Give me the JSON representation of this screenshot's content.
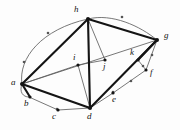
{
  "figure": {
    "background_color": "#fdfdfd",
    "stroke_color": "#141414",
    "thin_stroke_color": "#555555",
    "width": 180,
    "height": 130
  },
  "nodes": [
    {
      "id": "a",
      "label": "a",
      "x": 22,
      "y": 84,
      "label_x": 12,
      "label_y": 79
    },
    {
      "id": "b",
      "label": "b",
      "x": 29,
      "y": 97,
      "label_x": 25,
      "label_y": 100
    },
    {
      "id": "c",
      "label": "c",
      "x": 58,
      "y": 110,
      "label_x": 53,
      "label_y": 113
    },
    {
      "id": "d",
      "label": "d",
      "x": 90,
      "y": 108,
      "label_x": 87,
      "label_y": 113
    },
    {
      "id": "e",
      "label": "e",
      "x": 113,
      "y": 93,
      "label_x": 112,
      "label_y": 97
    },
    {
      "id": "f",
      "label": "f",
      "x": 146,
      "y": 70,
      "label_x": 150,
      "label_y": 70
    },
    {
      "id": "g",
      "label": "g",
      "x": 157,
      "y": 40,
      "label_x": 164,
      "label_y": 34
    },
    {
      "id": "h",
      "label": "h",
      "x": 88,
      "y": 19,
      "label_x": 75,
      "label_y": 7
    },
    {
      "id": "i",
      "label": "i",
      "x": 78,
      "y": 65,
      "label_x": 73,
      "label_y": 55
    },
    {
      "id": "j",
      "label": "j",
      "x": 105,
      "y": 60,
      "label_x": 104,
      "label_y": 63
    },
    {
      "id": "k",
      "label": "k",
      "x": 138,
      "y": 60,
      "label_x": 130,
      "label_y": 50
    }
  ],
  "edges_thick": [
    {
      "from": "a",
      "to": "h",
      "width": 2.2
    },
    {
      "from": "a",
      "to": "d",
      "width": 2.2
    },
    {
      "from": "a",
      "to": "b",
      "width": 2.2
    },
    {
      "from": "h",
      "to": "d",
      "width": 2.2
    },
    {
      "from": "h",
      "to": "g",
      "width": 2.2
    },
    {
      "from": "d",
      "to": "g",
      "width": 2.2
    },
    {
      "from": "g",
      "to": "k",
      "width": 2.0
    },
    {
      "from": "k",
      "to": "d",
      "width": 1.2
    }
  ],
  "edges_thin": [
    {
      "from": "a",
      "to": "g",
      "width": 0.8
    },
    {
      "from": "a",
      "to": "i",
      "width": 0.8
    },
    {
      "from": "h",
      "to": "j",
      "width": 0.8
    },
    {
      "from": "i",
      "to": "d",
      "width": 0.8
    },
    {
      "from": "i",
      "to": "j",
      "width": 0.8
    },
    {
      "from": "j",
      "to": "g",
      "width": 0.8
    },
    {
      "from": "k",
      "to": "f",
      "width": 0.8
    },
    {
      "from": "g",
      "to": "f",
      "width": 0.8
    },
    {
      "from": "f",
      "to": "e",
      "width": 0.8
    },
    {
      "from": "e",
      "to": "d",
      "width": 0.8
    },
    {
      "from": "b",
      "to": "c",
      "width": 0.8
    },
    {
      "from": "c",
      "to": "d",
      "width": 0.8
    }
  ],
  "edges_curved": [
    {
      "from": "a",
      "to": "h",
      "note": "outer-arc-left",
      "path": "M 22 84 C 20 58, 44 30, 88 19",
      "width": 0.8
    },
    {
      "from": "h",
      "to": "g",
      "note": "outer-arc-top",
      "path": "M 88 19 C 112 14, 140 26, 157 40",
      "width": 0.8
    },
    {
      "from": "a",
      "to": "b",
      "note": "outer-arc-lower-left",
      "path": "M 22 84 C 20 92, 24 96, 29 97",
      "width": 0.8
    }
  ],
  "arrow_markers": [
    {
      "on_edge": "a-h-arc",
      "x": 25,
      "y": 62,
      "angle": -62
    },
    {
      "on_edge": "a-h-arc",
      "x": 49,
      "y": 34,
      "angle": -38
    },
    {
      "on_edge": "h-g-arc",
      "x": 123,
      "y": 18,
      "angle": 16
    },
    {
      "on_edge": "b-c",
      "x": 58,
      "y": 110,
      "angle": 22
    },
    {
      "on_edge": "e-d",
      "x": 113,
      "y": 93,
      "angle": -140
    },
    {
      "on_edge": "f-e",
      "x": 130,
      "y": 82,
      "angle": 145
    },
    {
      "on_edge": "g-f",
      "x": 152,
      "y": 56,
      "angle": 108
    },
    {
      "on_edge": "k-f",
      "x": 142,
      "y": 65,
      "angle": 50
    }
  ],
  "node_style": {
    "radius": 1.8,
    "fill": "#141414"
  }
}
